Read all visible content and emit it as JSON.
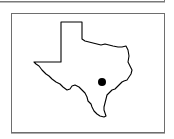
{
  "map": {
    "region": "Texas",
    "marker": {
      "shape": "dot",
      "color": "#000000",
      "cx": 102,
      "cy": 82,
      "r": 4
    },
    "outline_color": "#000000",
    "frame_color": "#6e6e6e"
  }
}
